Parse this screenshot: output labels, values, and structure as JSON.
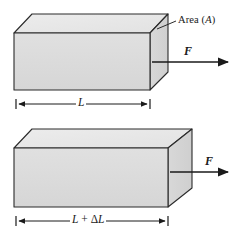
{
  "figure": {
    "background_color": "#ffffff",
    "outline_color": "#2b2b2b",
    "face_front_color": "#dcdcdc",
    "face_top_color": "#e8e8e8",
    "face_side_color": "#d2d2d2",
    "arrow_color": "#1a1a1a",
    "leader_color": "#2b2b2b"
  },
  "labels": {
    "area": {
      "text_prefix": "Area (",
      "text_symbol": "A",
      "text_suffix": ")",
      "full": "Area (A)"
    },
    "force_top": "F",
    "force_bottom": "F",
    "dimension_top": "L",
    "dimension_bottom_prefix": "L",
    "dimension_bottom_op": " + ",
    "dimension_bottom_delta": "Δ",
    "dimension_bottom_suffix": "L",
    "dimension_bottom_full": "L + ΔL"
  },
  "shapes": {
    "top_box": {
      "name": "undeformed-block",
      "front_face": "14,33 150,33 150,90 14,90",
      "top_face": "14,33 32,14 168,14 150,33",
      "side_face": "150,33 168,14 168,72 150,90"
    },
    "bottom_box": {
      "name": "stretched-block",
      "front_face": "14,148 168,148 168,207 14,207",
      "top_face": "14,148 32,129 192,129 168,148",
      "side_face": "168,148 192,129 192,188 168,207"
    },
    "arrows": {
      "top_force": {
        "x1": 152,
        "y1": 62,
        "x2": 231,
        "y2": 62
      },
      "bottom_force": {
        "x1": 170,
        "y1": 172,
        "x2": 231,
        "y2": 172
      }
    },
    "dimension_lines": {
      "top": {
        "x1": 16,
        "x2": 150,
        "y": 104,
        "tick_half_height": 5
      },
      "bottom": {
        "x1": 16,
        "x2": 168,
        "y": 221,
        "tick_half_height": 5
      }
    },
    "leader_line": {
      "x1": 158,
      "y1": 28,
      "x2": 176,
      "y2": 21
    }
  }
}
